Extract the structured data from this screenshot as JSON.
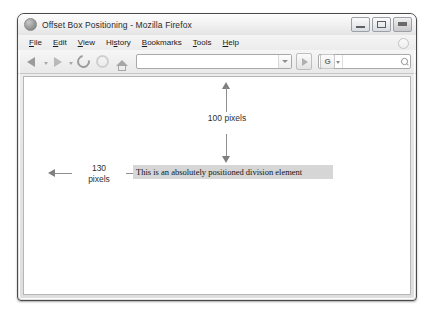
{
  "window": {
    "title": "Offset Box Positioning - Mozilla Firefox",
    "app_icon": "firefox-icon",
    "controls": {
      "minimize": "minimize-icon",
      "maximize": "maximize-icon",
      "close": "close-icon"
    }
  },
  "menubar": {
    "items": [
      {
        "label": "File",
        "accel": "F"
      },
      {
        "label": "Edit",
        "accel": "E"
      },
      {
        "label": "View",
        "accel": "V"
      },
      {
        "label": "History",
        "accel": "s"
      },
      {
        "label": "Bookmarks",
        "accel": "B"
      },
      {
        "label": "Tools",
        "accel": "T"
      },
      {
        "label": "Help",
        "accel": "H"
      }
    ]
  },
  "toolbar": {
    "back_icon": "back-arrow-icon",
    "forward_icon": "forward-arrow-icon",
    "reload_icon": "reload-icon",
    "stop_icon": "stop-icon",
    "home_icon": "home-icon",
    "url_value": "",
    "url_placeholder": "",
    "url_dropdown_icon": "chevron-down-icon",
    "go_icon": "go-arrow-icon",
    "search_engine_label": "G",
    "search_engine_icon": "google-icon",
    "search_value": "",
    "search_placeholder": "",
    "search_icon": "magnifier-icon"
  },
  "page": {
    "vertical_measure": {
      "label": "100 pixels",
      "value": 100,
      "unit": "pixels"
    },
    "horizontal_measure": {
      "label_line1": "130",
      "label_line2": "pixels",
      "value": 130,
      "unit": "pixels"
    },
    "positioned_box": {
      "text": "This is an absolutely positioned division element",
      "background": "#d6d6d6"
    }
  },
  "colors": {
    "frame_border": "#4a4a4a",
    "arrow": "#7f7f7f",
    "content_background": "#ffffff",
    "box_background": "#d6d6d6"
  }
}
